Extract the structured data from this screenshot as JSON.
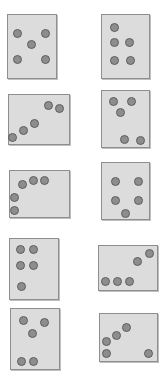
{
  "figure": {
    "panel_count": 10,
    "dots_per_panel": 5,
    "colors": {
      "background": "#ffffff",
      "panel_fill": "#dcdcdc",
      "panel_border": "#8e8e8e",
      "panel_shadow": "#bfbfbf",
      "dot_fill": "#8d8d8d",
      "dot_border": "#5e5e5e"
    },
    "dot_diameter": 9
  },
  "panels": [
    {
      "id": "panel-1",
      "label": "row-1-left",
      "arrangement": "dice-five",
      "rect": {
        "x": 7,
        "y": 14,
        "w": 50,
        "h": 65
      },
      "dots": [
        {
          "cx": 17,
          "cy": 33
        },
        {
          "cx": 45,
          "cy": 33
        },
        {
          "cx": 31,
          "cy": 44
        },
        {
          "cx": 17,
          "cy": 59
        },
        {
          "cx": 45,
          "cy": 59
        }
      ]
    },
    {
      "id": "panel-2",
      "label": "row-1-right",
      "arrangement": "one-top-two-middle-two-bottom",
      "rect": {
        "x": 101,
        "y": 14,
        "w": 49,
        "h": 65
      },
      "dots": [
        {
          "cx": 114,
          "cy": 27
        },
        {
          "cx": 114,
          "cy": 42
        },
        {
          "cx": 129,
          "cy": 42
        },
        {
          "cx": 114,
          "cy": 60
        },
        {
          "cx": 130,
          "cy": 60
        }
      ]
    },
    {
      "id": "panel-3",
      "label": "row-2-left",
      "arrangement": "ascending-diagonal-chain",
      "rect": {
        "x": 8,
        "y": 94,
        "w": 62,
        "h": 51
      },
      "dots": [
        {
          "cx": 12,
          "cy": 137
        },
        {
          "cx": 23,
          "cy": 130
        },
        {
          "cx": 34,
          "cy": 123
        },
        {
          "cx": 48,
          "cy": 105
        },
        {
          "cx": 59,
          "cy": 108
        }
      ]
    },
    {
      "id": "panel-4",
      "label": "row-2-right",
      "arrangement": "three-top-cluster-two-bottom",
      "rect": {
        "x": 101,
        "y": 90,
        "w": 49,
        "h": 58
      },
      "dots": [
        {
          "cx": 113,
          "cy": 101
        },
        {
          "cx": 131,
          "cy": 101
        },
        {
          "cx": 120,
          "cy": 112
        },
        {
          "cx": 124,
          "cy": 139
        },
        {
          "cx": 140,
          "cy": 140
        }
      ]
    },
    {
      "id": "panel-5",
      "label": "row-3-left",
      "arrangement": "L-shaped-corner-arc",
      "rect": {
        "x": 9,
        "y": 170,
        "w": 61,
        "h": 48
      },
      "dots": [
        {
          "cx": 14,
          "cy": 210
        },
        {
          "cx": 14,
          "cy": 197
        },
        {
          "cx": 22,
          "cy": 184
        },
        {
          "cx": 33,
          "cy": 180
        },
        {
          "cx": 44,
          "cy": 180
        }
      ]
    },
    {
      "id": "panel-6",
      "label": "row-3-right",
      "arrangement": "two-columns-plus-one-bottom",
      "rect": {
        "x": 101,
        "y": 162,
        "w": 49,
        "h": 58
      },
      "dots": [
        {
          "cx": 115,
          "cy": 181
        },
        {
          "cx": 138,
          "cy": 181
        },
        {
          "cx": 115,
          "cy": 200
        },
        {
          "cx": 138,
          "cy": 200
        },
        {
          "cx": 125,
          "cy": 213
        }
      ]
    },
    {
      "id": "panel-7",
      "label": "row-4-left",
      "arrangement": "two-by-two-block-plus-one",
      "rect": {
        "x": 9,
        "y": 238,
        "w": 50,
        "h": 62
      },
      "dots": [
        {
          "cx": 20,
          "cy": 249
        },
        {
          "cx": 33,
          "cy": 249
        },
        {
          "cx": 20,
          "cy": 265
        },
        {
          "cx": 33,
          "cy": 265
        },
        {
          "cx": 21,
          "cy": 286
        }
      ]
    },
    {
      "id": "panel-8",
      "label": "row-4-right",
      "arrangement": "three-in-row-plus-two-diagonal",
      "rect": {
        "x": 98,
        "y": 245,
        "w": 60,
        "h": 46
      },
      "dots": [
        {
          "cx": 105,
          "cy": 281
        },
        {
          "cx": 117,
          "cy": 281
        },
        {
          "cx": 129,
          "cy": 281
        },
        {
          "cx": 137,
          "cy": 261
        },
        {
          "cx": 149,
          "cy": 253
        }
      ]
    },
    {
      "id": "panel-9",
      "label": "row-5-left",
      "arrangement": "triangle-top-pair-bottom",
      "rect": {
        "x": 10,
        "y": 308,
        "w": 50,
        "h": 62
      },
      "dots": [
        {
          "cx": 23,
          "cy": 320
        },
        {
          "cx": 44,
          "cy": 322
        },
        {
          "cx": 32,
          "cy": 333
        },
        {
          "cx": 21,
          "cy": 361
        },
        {
          "cx": 33,
          "cy": 361
        }
      ]
    },
    {
      "id": "panel-10",
      "label": "row-5-right",
      "arrangement": "diagonal-chain-plus-outlier",
      "rect": {
        "x": 99,
        "y": 313,
        "w": 59,
        "h": 49
      },
      "dots": [
        {
          "cx": 106,
          "cy": 353
        },
        {
          "cx": 106,
          "cy": 341
        },
        {
          "cx": 116,
          "cy": 335
        },
        {
          "cx": 126,
          "cy": 327
        },
        {
          "cx": 148,
          "cy": 353
        }
      ]
    }
  ]
}
